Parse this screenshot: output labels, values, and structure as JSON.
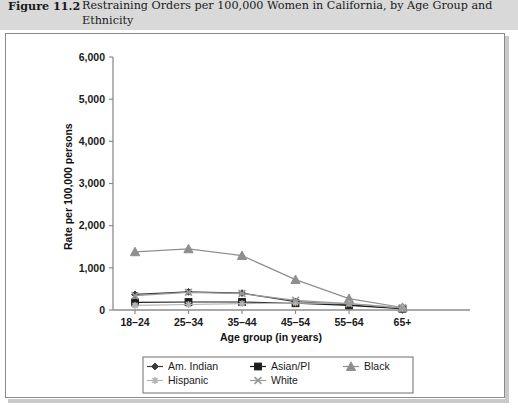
{
  "caption": {
    "number": "Figure 11.2",
    "text": "Restraining Orders per 100,000 Women in California, by Age Group and Ethnicity"
  },
  "chart_data": {
    "type": "line",
    "title": "Restraining Orders per 100,000 Women in California, by Age Group and Ethnicity",
    "xlabel": "Age group (in years)",
    "ylabel": "Rate per 100,000 persons",
    "categories": [
      "18–24",
      "25–34",
      "35–44",
      "45–54",
      "55–64",
      "65+"
    ],
    "ylim": [
      0,
      6000
    ],
    "ytick_labels": [
      "0",
      "1,000",
      "2,000",
      "3,000",
      "4,000",
      "5,000",
      "6,000"
    ],
    "ytick_values": [
      0,
      1000,
      2000,
      3000,
      4000,
      5000,
      6000
    ],
    "grid": false,
    "legend_position": "bottom",
    "series": [
      {
        "name": "Am. Indian",
        "marker": "diamond",
        "color": "#3b3b3b",
        "values": [
          370,
          430,
          400,
          200,
          120,
          40
        ]
      },
      {
        "name": "Asian/PI",
        "marker": "square",
        "color": "#1c1c1c",
        "values": [
          180,
          190,
          190,
          160,
          110,
          30
        ]
      },
      {
        "name": "Black",
        "marker": "triangle",
        "color": "#8f8f8f",
        "values": [
          1380,
          1450,
          1290,
          720,
          270,
          60
        ]
      },
      {
        "name": "Hispanic",
        "marker": "star",
        "color": "#b4b4b4",
        "values": [
          110,
          130,
          150,
          170,
          150,
          50
        ]
      },
      {
        "name": "White",
        "marker": "cross",
        "color": "#9a9a9a",
        "values": [
          340,
          420,
          390,
          230,
          150,
          50
        ]
      }
    ]
  },
  "legend": {
    "items": [
      {
        "label": "Am. Indian",
        "marker": "diamond-marker"
      },
      {
        "label": "Asian/PI",
        "marker": "square-marker"
      },
      {
        "label": "Black",
        "marker": "triangle-marker"
      },
      {
        "label": "Hispanic",
        "marker": "star-marker"
      },
      {
        "label": "White",
        "marker": "cross-marker"
      }
    ]
  },
  "colors": {
    "caption_band": "#d9d9d9",
    "panel_border": "#8a8a8a",
    "axis": "#8c8c8c"
  }
}
